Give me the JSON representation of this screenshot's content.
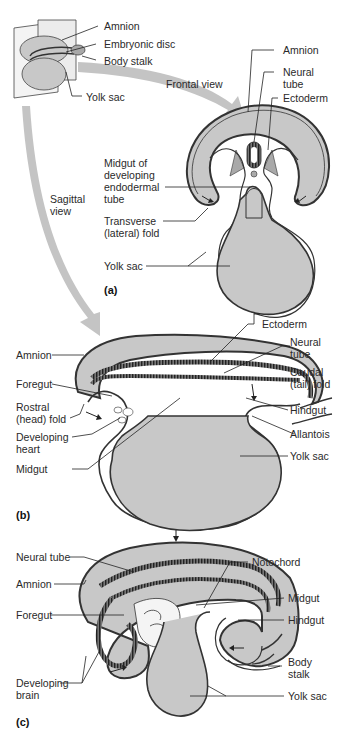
{
  "figure": {
    "type": "embryonic folding diagram",
    "colors": {
      "tissue_fill": "#c8c8c8",
      "outline": "#3a3a3a",
      "arrow_fill": "#c4c4c4",
      "background": "#ffffff"
    },
    "inset": {
      "labels": [
        "Amnion",
        "Embryonic disc",
        "Body stalk",
        "Yolk sac"
      ]
    },
    "arrows": {
      "frontal": "Frontal view",
      "sagittal_line1": "Sagittal",
      "sagittal_line2": "view"
    },
    "panel_a": {
      "tag": "(a)",
      "labels": {
        "amnion": "Amnion",
        "neural_tube_1": "Neural",
        "neural_tube_2": "tube",
        "ectoderm": "Ectoderm",
        "midgut_1": "Midgut of",
        "midgut_2": "developing",
        "midgut_3": "endodermal",
        "midgut_4": "tube",
        "transverse_1": "Transverse",
        "transverse_2": "(lateral) fold",
        "yolk_sac": "Yolk sac"
      }
    },
    "panel_b": {
      "tag": "(b)",
      "labels": {
        "ectoderm": "Ectoderm",
        "amnion": "Amnion",
        "neural_tube_1": "Neural",
        "neural_tube_2": "tube",
        "foregut": "Foregut",
        "caudal_1": "Caudal",
        "caudal_2": "(tail) fold",
        "rostral_1": "Rostral",
        "rostral_2": "(head) fold",
        "hindgut": "Hindgut",
        "heart_1": "Developing",
        "heart_2": "heart",
        "allantois": "Allantois",
        "midgut": "Midgut",
        "yolk_sac": "Yolk sac"
      }
    },
    "panel_c": {
      "tag": "(c)",
      "labels": {
        "neural_tube": "Neural tube",
        "notochord": "Notochord",
        "amnion": "Amnion",
        "midgut": "Midgut",
        "foregut": "Foregut",
        "hindgut": "Hindgut",
        "body_stalk_1": "Body",
        "body_stalk_2": "stalk",
        "brain_1": "Developing",
        "brain_2": "brain",
        "yolk_sac": "Yolk sac"
      }
    }
  }
}
